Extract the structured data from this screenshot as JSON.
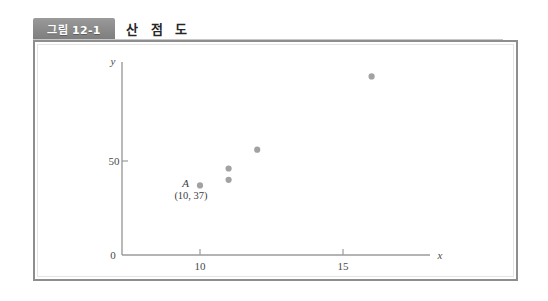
{
  "header": {
    "figure_tag": "그림 12-1",
    "figure_title": "산 점 도"
  },
  "colors": {
    "tag_background": "#8d8d8d",
    "tag_text": "#ffffff",
    "title_text": "#262626",
    "frame_border": "#8e8e8e",
    "axis": "#9b9b9b",
    "point": "#a2a2a2",
    "label_text": "#3d3d3d",
    "page_background": "#ffffff"
  },
  "chart_data": {
    "type": "scatter",
    "title": "산 점 도",
    "xlabel": "x",
    "ylabel": "y",
    "xlim": [
      7.2,
      17.8
    ],
    "ylim": [
      0,
      105
    ],
    "xticks": [
      10,
      15
    ],
    "xticklabels": [
      "10",
      "15"
    ],
    "yticks": [
      0,
      50
    ],
    "yticklabels": [
      "0",
      "50"
    ],
    "grid": false,
    "legend": null,
    "points": [
      {
        "x": 10,
        "y": 37,
        "label": "A",
        "coords_label": "(10, 37)"
      },
      {
        "x": 11,
        "y": 46,
        "label": "",
        "coords_label": ""
      },
      {
        "x": 11,
        "y": 40,
        "label": "",
        "coords_label": ""
      },
      {
        "x": 12,
        "y": 56,
        "label": "",
        "coords_label": ""
      },
      {
        "x": 16,
        "y": 95,
        "label": "",
        "coords_label": ""
      }
    ],
    "annotations": [
      {
        "letter": "A",
        "coords": "(10, 37)",
        "for_point": {
          "x": 10,
          "y": 37
        }
      }
    ]
  }
}
